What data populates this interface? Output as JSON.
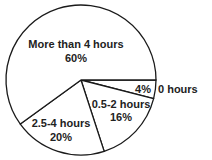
{
  "chart_data": {
    "type": "pie",
    "title": "",
    "categories": [
      "0 hours",
      "0.5-2 hours",
      "2.5-4 hours",
      "More than 4 hours"
    ],
    "values": [
      4,
      16,
      20,
      60
    ],
    "unit": "%",
    "value_labels": [
      "4%",
      "16%",
      "20%",
      "60%"
    ],
    "start_angle_deg": 0,
    "direction": "clockwise",
    "colors": [
      "#ffffff",
      "#ffffff",
      "#ffffff",
      "#ffffff"
    ],
    "stroke_color": "#1a1a1a",
    "legend": "none",
    "label_positions": {
      "0 hours": "outside-right",
      "others": "inside"
    }
  },
  "labels": {
    "zero": {
      "category": "0 hours",
      "value": "4%"
    },
    "half_to_two": {
      "category": "0.5-2 hours",
      "value": "16%"
    },
    "two_half_to_four": {
      "category": "2.5-4 hours",
      "value": "20%"
    },
    "more_than_four": {
      "category": "More than 4 hours",
      "value": "60%"
    }
  }
}
